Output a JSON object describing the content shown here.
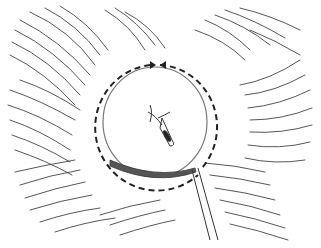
{
  "illustration": {
    "subject": "surgical sketch of circular opening with dashed rotation arrows and instrument",
    "colors": {
      "stroke": "#333333",
      "background": "#ffffff",
      "shade": "#555555"
    }
  }
}
